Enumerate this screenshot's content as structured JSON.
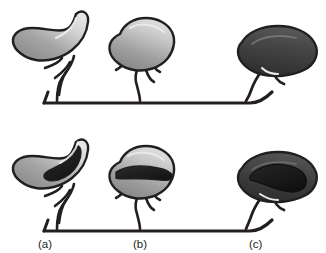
{
  "figure": {
    "title": "",
    "background_color": "#ffffff",
    "width": 326,
    "height": 253,
    "outline_color": "#231f20",
    "baseline_color": "#231f20"
  },
  "labels": {
    "a": "(a)",
    "b": "(b)",
    "c": "(c)"
  },
  "colors": {
    "outline": "#231f20",
    "light_gray": "#d8d8d8",
    "mid_gray": "#9a9a9a",
    "dark_gray": "#6e6e6e",
    "darker_gray": "#4a4a4a",
    "near_black": "#2b2b2b",
    "lumen_black": "#1a1a1a",
    "white": "#ffffff",
    "label_text": "#231f20"
  },
  "rows": [
    {
      "row_name": "top-row",
      "description": "exterior view",
      "panels": [
        {
          "key": "a",
          "fill_tone": "light",
          "has_lumen": false
        },
        {
          "key": "b",
          "fill_tone": "light",
          "has_lumen": false
        },
        {
          "key": "c",
          "fill_tone": "dark",
          "has_lumen": false
        }
      ]
    },
    {
      "row_name": "bottom-row",
      "description": "sectioned view with internal cavity",
      "panels": [
        {
          "key": "a",
          "fill_tone": "light",
          "has_lumen": true
        },
        {
          "key": "b",
          "fill_tone": "light",
          "has_lumen": true
        },
        {
          "key": "c",
          "fill_tone": "dark",
          "has_lumen": true
        }
      ]
    }
  ]
}
